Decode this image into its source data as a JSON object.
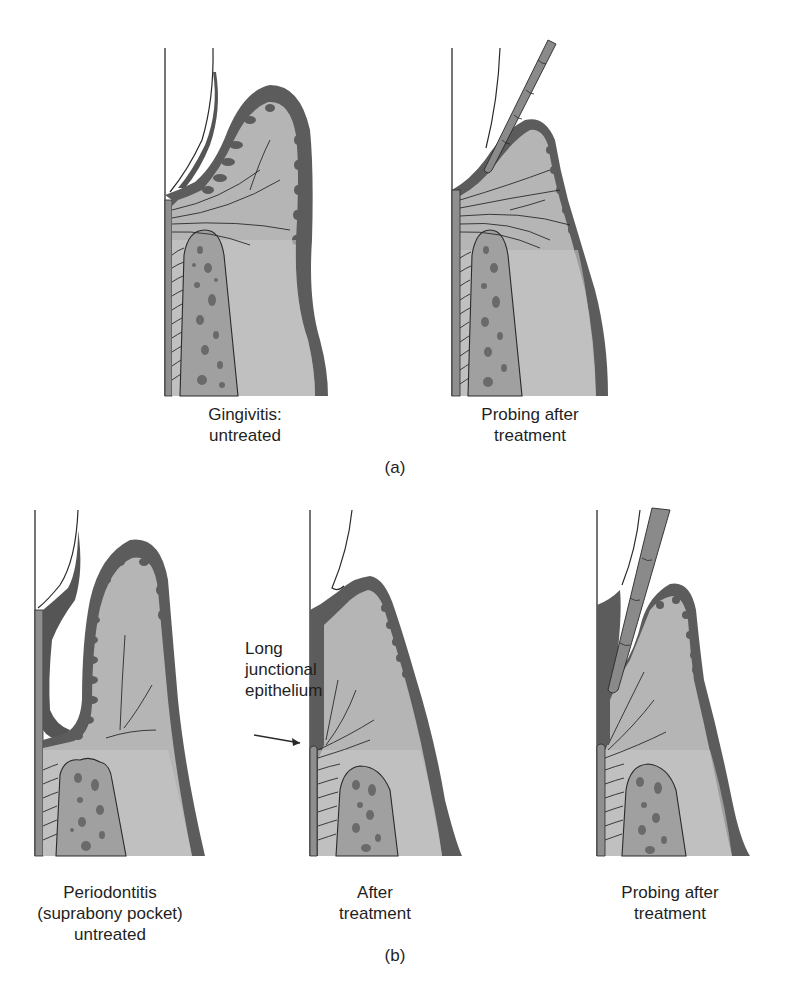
{
  "colors": {
    "epithelium_dark": "#5c5c5c",
    "connective_tissue": "#b5b5b5",
    "connective_light": "#cfcfcf",
    "bone": "#a0a0a0",
    "bone_marrow": "#6a6a6a",
    "cementum": "#8f8f8f",
    "probe": "#8a8a8a",
    "line": "#2a2a2a",
    "background": "#ffffff"
  },
  "panel_a": {
    "label": "(a)",
    "figures": [
      {
        "id": "gingivitis-untreated",
        "caption_lines": [
          "Gingivitis:",
          "untreated"
        ]
      },
      {
        "id": "probing-after-treatment",
        "caption_lines": [
          "Probing after",
          "treatment"
        ]
      }
    ]
  },
  "panel_b": {
    "label": "(b)",
    "figures": [
      {
        "id": "periodontitis-untreated",
        "caption_lines": [
          "Periodontitis",
          "(suprabony pocket)",
          "untreated"
        ]
      },
      {
        "id": "after-treatment",
        "caption_lines": [
          "After",
          "treatment"
        ]
      },
      {
        "id": "probing-after-treatment",
        "caption_lines": [
          "Probing after",
          "treatment"
        ]
      }
    ],
    "annotation": {
      "lines": [
        "Long",
        "junctional",
        "epithelium"
      ],
      "points_to": "after-treatment"
    }
  }
}
